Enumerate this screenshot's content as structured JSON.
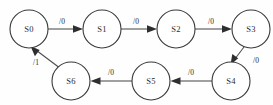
{
  "diagram": {
    "type": "state-transition-diagram",
    "background_color": "#fefefe",
    "node_fill": "#ffffff",
    "node_stroke": "#3a3a3a",
    "edge_color": "#4a4a4a",
    "text_color": "#2b2b2b",
    "states": [
      {
        "id": "S0",
        "label": "S0",
        "cx": 29,
        "cy": 29,
        "r": 19
      },
      {
        "id": "S1",
        "label": "S1",
        "cx": 102,
        "cy": 29,
        "r": 19
      },
      {
        "id": "S2",
        "label": "S2",
        "cx": 176,
        "cy": 29,
        "r": 19
      },
      {
        "id": "S3",
        "label": "S3",
        "cx": 251,
        "cy": 29,
        "r": 19
      },
      {
        "id": "S4",
        "label": "S4",
        "cx": 231,
        "cy": 81,
        "r": 19
      },
      {
        "id": "S5",
        "label": "S5",
        "cx": 151,
        "cy": 81,
        "r": 19
      },
      {
        "id": "S6",
        "label": "S6",
        "cx": 71,
        "cy": 81,
        "r": 19
      }
    ],
    "transitions": [
      {
        "id": "t0",
        "from": "S0",
        "to": "S1",
        "label": "/0",
        "label_x": 62,
        "label_y": 21
      },
      {
        "id": "t1",
        "from": "S1",
        "to": "S2",
        "label": "/0",
        "label_x": 136,
        "label_y": 21
      },
      {
        "id": "t2",
        "from": "S2",
        "to": "S3",
        "label": "/0",
        "label_x": 211,
        "label_y": 21
      },
      {
        "id": "t3",
        "from": "S3",
        "to": "S4",
        "label": "/0",
        "label_x": 256,
        "label_y": 60
      },
      {
        "id": "t4",
        "from": "S4",
        "to": "S5",
        "label": "/0",
        "label_x": 191,
        "label_y": 72
      },
      {
        "id": "t5",
        "from": "S5",
        "to": "S6",
        "label": "/0",
        "label_x": 111,
        "label_y": 72
      },
      {
        "id": "t6",
        "from": "S6",
        "to": "S0",
        "label": "/1",
        "label_x": 36,
        "label_y": 62
      }
    ]
  }
}
